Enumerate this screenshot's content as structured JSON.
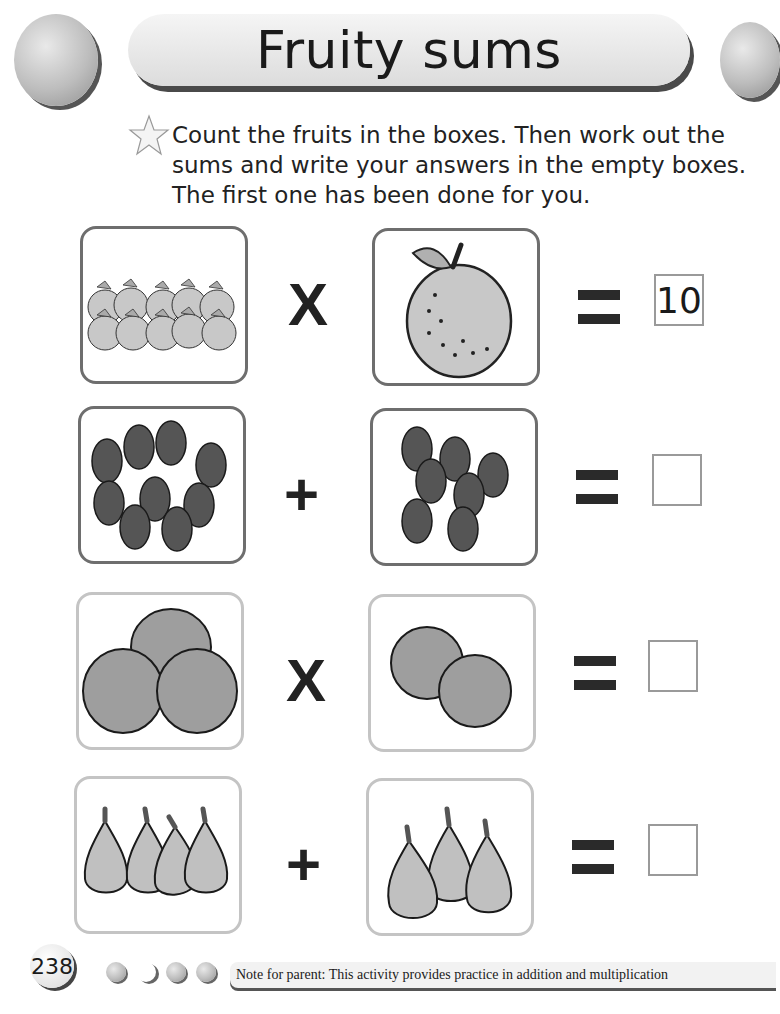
{
  "header": {
    "title": "Fruity sums"
  },
  "instructions": {
    "icon": "star-icon",
    "text": "Count the fruits in the boxes. Then work out the sums and write your answers in the empty boxes. The first one has been done for you."
  },
  "problems": [
    {
      "left": {
        "fruit": "apple",
        "count": 10
      },
      "operator": "X",
      "right": {
        "fruit": "apple",
        "count": 1
      },
      "equals": "=",
      "answer": "10"
    },
    {
      "left": {
        "fruit": "blackberry",
        "count": 9
      },
      "operator": "+",
      "right": {
        "fruit": "blackberry",
        "count": 7
      },
      "equals": "=",
      "answer": ""
    },
    {
      "left": {
        "fruit": "orange",
        "count": 3
      },
      "operator": "X",
      "right": {
        "fruit": "orange",
        "count": 2
      },
      "equals": "=",
      "answer": ""
    },
    {
      "left": {
        "fruit": "pear",
        "count": 4
      },
      "operator": "+",
      "right": {
        "fruit": "pear",
        "count": 3
      },
      "equals": "=",
      "answer": ""
    }
  ],
  "footer": {
    "page_number": "238",
    "note": "Note for parent: This activity provides practice in addition and multiplication"
  },
  "colors": {
    "fruit_fill": "#c8c8c8",
    "dark_fruit": "#555555",
    "box_border": "#6e6e6e"
  }
}
